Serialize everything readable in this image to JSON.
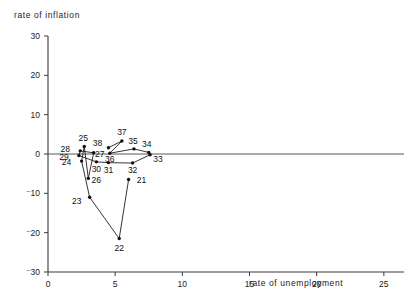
{
  "chart_data": {
    "type": "scatter",
    "title": "",
    "xlabel": "rate of unemployment",
    "ylabel": "rate of inflation",
    "xlim": [
      0,
      26.5
    ],
    "ylim": [
      -30,
      30
    ],
    "xticks": [
      "0",
      "5",
      "10",
      "15",
      "20",
      "25"
    ],
    "xtick_values": [
      0,
      5,
      10,
      15,
      20,
      25
    ],
    "yticks": [
      "30",
      "20",
      "10",
      "0",
      "⁻10",
      "⁻20",
      "⁻30"
    ],
    "ytick_values": [
      30,
      20,
      10,
      0,
      -10,
      -20,
      -30
    ],
    "grid": false,
    "legend": false,
    "connected": true,
    "note": "Phillips-curve style trajectory, points labelled by year 21-38",
    "points": [
      {
        "label": "21",
        "x": 6.0,
        "y": -6.5,
        "lx": 13,
        "ly": 3
      },
      {
        "label": "22",
        "x": 5.3,
        "y": -21.5,
        "lx": 0,
        "ly": 12
      },
      {
        "label": "23",
        "x": 3.1,
        "y": -11.0,
        "lx": -13,
        "ly": 7
      },
      {
        "label": "24",
        "x": 2.5,
        "y": -1.8,
        "lx": -15,
        "ly": 4
      },
      {
        "label": "25",
        "x": 2.7,
        "y": 1.9,
        "lx": -1,
        "ly": -6
      },
      {
        "label": "26",
        "x": 3.0,
        "y": -6.2,
        "lx": 8,
        "ly": 5
      },
      {
        "label": "27",
        "x": 3.4,
        "y": 0.3,
        "lx": 6,
        "ly": 4
      },
      {
        "label": "28",
        "x": 2.4,
        "y": 0.8,
        "lx": -15,
        "ly": 1
      },
      {
        "label": "29",
        "x": 2.3,
        "y": -0.4,
        "lx": -15,
        "ly": 4
      },
      {
        "label": "30",
        "x": 3.6,
        "y": -2.0,
        "lx": 0,
        "ly": 10
      },
      {
        "label": "31",
        "x": 4.5,
        "y": -2.2,
        "lx": 0,
        "ly": 10
      },
      {
        "label": "32",
        "x": 6.3,
        "y": -2.3,
        "lx": 0,
        "ly": 10
      },
      {
        "label": "33",
        "x": 7.6,
        "y": -0.2,
        "lx": 8,
        "ly": 7
      },
      {
        "label": "34",
        "x": 7.5,
        "y": 0.4,
        "lx": -2,
        "ly": -5
      },
      {
        "label": "35",
        "x": 6.4,
        "y": 1.3,
        "lx": -1,
        "ly": -5
      },
      {
        "label": "36",
        "x": 4.6,
        "y": 0.2,
        "lx": 0,
        "ly": 9
      },
      {
        "label": "37",
        "x": 5.5,
        "y": 3.3,
        "lx": 0,
        "ly": -6
      },
      {
        "label": "38",
        "x": 4.5,
        "y": 1.6,
        "lx": -11,
        "ly": -2
      }
    ]
  }
}
